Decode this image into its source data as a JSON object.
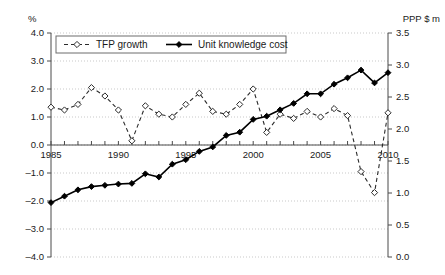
{
  "chart_data": {
    "type": "line",
    "title": "",
    "xlabel": "",
    "ylabel": "%",
    "y2label": "PPP $ m",
    "grid": true,
    "legend_position": "top-left-inside",
    "x": [
      1985,
      1986,
      1987,
      1988,
      1989,
      1990,
      1991,
      1992,
      1993,
      1994,
      1995,
      1996,
      1997,
      1998,
      1999,
      2000,
      2001,
      2002,
      2003,
      2004,
      2005,
      2006,
      2007,
      2008,
      2009,
      2010
    ],
    "xlim": [
      1985,
      2010
    ],
    "xticks": [
      1985,
      1990,
      1995,
      2000,
      2005,
      2010
    ],
    "xticklabels": [
      "1985",
      "1990",
      "1995",
      "2000",
      "2005",
      "2010"
    ],
    "ylim": [
      -4.0,
      4.0
    ],
    "yticks": [
      -4.0,
      -3.0,
      -2.0,
      -1.0,
      0.0,
      1.0,
      2.0,
      3.0,
      4.0
    ],
    "yticklabels": [
      "–4.0",
      "–3.0",
      "–2.0",
      "–1.0",
      "0.0",
      "1.0",
      "2.0",
      "3.0",
      "4.0"
    ],
    "y2lim": [
      0.0,
      3.5
    ],
    "y2ticks": [
      0.0,
      0.5,
      1.0,
      1.5,
      2.0,
      2.5,
      3.0,
      3.5
    ],
    "y2ticklabels": [
      "0.0",
      "0.5",
      "1.0",
      "1.5",
      "2.0",
      "2.5",
      "3.0",
      "3.5"
    ],
    "series": [
      {
        "name": "TFP growth",
        "axis": "left",
        "style": "dashed",
        "marker": "open-diamond",
        "values": [
          1.35,
          1.25,
          1.45,
          2.05,
          1.75,
          1.25,
          0.15,
          1.4,
          1.1,
          1.0,
          1.45,
          1.85,
          1.2,
          1.1,
          1.45,
          2.0,
          0.45,
          1.1,
          0.95,
          1.2,
          1.0,
          1.3,
          1.05,
          -0.95,
          -1.7,
          1.15
        ]
      },
      {
        "name": "Unit knowledge cost",
        "axis": "right",
        "style": "solid",
        "marker": "filled-diamond",
        "values": [
          0.85,
          0.95,
          1.05,
          1.1,
          1.12,
          1.14,
          1.15,
          1.3,
          1.25,
          1.45,
          1.52,
          1.65,
          1.72,
          1.9,
          1.95,
          2.15,
          2.2,
          2.3,
          2.4,
          2.55,
          2.55,
          2.7,
          2.8,
          2.92,
          2.72,
          2.88
        ]
      }
    ],
    "legend": [
      {
        "label": "TFP growth",
        "style": "dashed",
        "marker": "open-diamond"
      },
      {
        "label": "Unit knowledge cost",
        "style": "solid",
        "marker": "filled-diamond"
      }
    ]
  }
}
